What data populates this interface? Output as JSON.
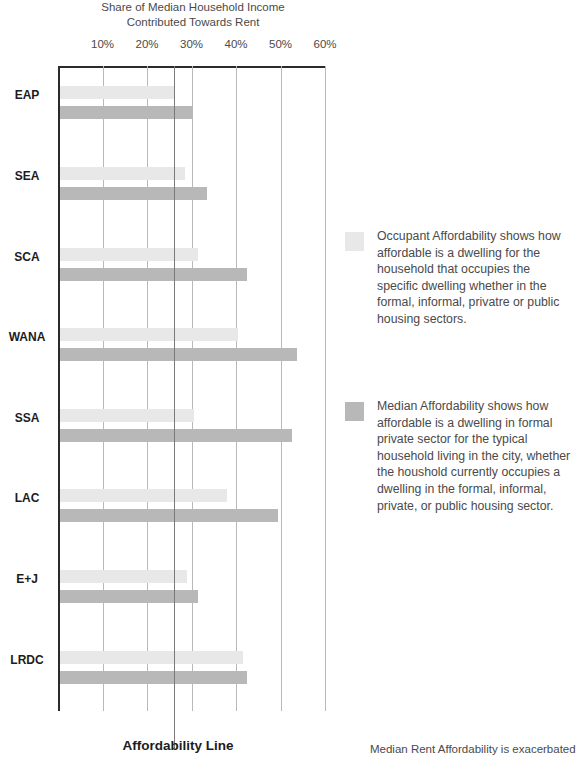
{
  "chart_data": {
    "type": "bar",
    "orientation": "horizontal",
    "title": "Share of Median Household Income Contributed Towards Rent",
    "title_lines": [
      "Share of Median Household Income",
      "Contributed Towards Rent"
    ],
    "xlabel": "",
    "ylabel": "",
    "xlim": [
      0,
      65
    ],
    "grid": true,
    "axis_position": "top",
    "legend_position": "right",
    "tick_labels": [
      "10%",
      "20%",
      "30%",
      "40%",
      "50%",
      "60%"
    ],
    "tick_values": [
      10,
      20,
      30,
      40,
      50,
      60
    ],
    "categories": [
      "EAP",
      "SEA",
      "SCA",
      "WANA",
      "SSA",
      "LAC",
      "E+J",
      "LRDC"
    ],
    "series": [
      {
        "name": "Occupant Affordability",
        "color": "#e8e8e8",
        "values": [
          26.0,
          28.5,
          31.5,
          40.5,
          30.5,
          38.0,
          29.0,
          41.5
        ]
      },
      {
        "name": "Median Affordability",
        "color": "#b8b8b8",
        "values": [
          30.0,
          33.5,
          42.5,
          53.8,
          52.5,
          49.5,
          31.5,
          42.5
        ]
      }
    ],
    "annotations": [
      {
        "name": "affordability-line",
        "label": "Affordability Line",
        "value": 26,
        "color": "#7a7a7a"
      }
    ]
  },
  "legend": {
    "entries": [
      {
        "swatch": "occupant",
        "label": "Occupant Affordability shows how affordable is a dwelling for the household that occupies the specific dwelling whether in the formal, informal, privatre or public housing sectors."
      },
      {
        "swatch": "median",
        "label": "Median Affordability shows how affordable is a dwelling in formal private sector for the typical household living in the city, whether the houshold currently occupies a dwelling in the formal, informal, private, or public housing sector."
      }
    ]
  },
  "footer": {
    "affordability_line_label": "Affordability Line",
    "body_text_fragment": "Median Rent Affordability is exacerbated"
  }
}
